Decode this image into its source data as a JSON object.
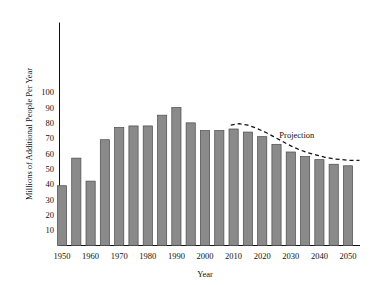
{
  "chart_data": {
    "type": "bar",
    "title": "",
    "xlabel": "Year",
    "ylabel": "Millions of Additional People Per Year",
    "xlim": [
      1947.5,
      2052.5
    ],
    "ylim": [
      0,
      108
    ],
    "grid": false,
    "legend": "none",
    "x_tick_labels": [
      "1950",
      "1960",
      "1970",
      "1980",
      "1990",
      "2000",
      "2010",
      "2020",
      "2030",
      "2040",
      "2050"
    ],
    "x_tick_values": [
      1950,
      1960,
      1970,
      1980,
      1990,
      2000,
      2010,
      2020,
      2030,
      2040,
      2050
    ],
    "y_tick_labels": [
      "10",
      "20",
      "30",
      "40",
      "50",
      "60",
      "70",
      "80",
      "90",
      "100"
    ],
    "y_tick_values": [
      10,
      20,
      30,
      40,
      50,
      60,
      70,
      80,
      90,
      100
    ],
    "categories": [
      1950,
      1955,
      1960,
      1965,
      1970,
      1975,
      1980,
      1985,
      1990,
      1995,
      2000,
      2005,
      2010,
      2015,
      2020,
      2025,
      2030,
      2035,
      2040,
      2045,
      2050
    ],
    "values": [
      39,
      57,
      42,
      69,
      77,
      78,
      78,
      85,
      90,
      80,
      75,
      75,
      76,
      74,
      71,
      66,
      61,
      58,
      56,
      53,
      52
    ],
    "bar_color": "#8a8a8a",
    "bar_edge_color": "#4a4a4a",
    "annotations": [
      {
        "name": "projection-label",
        "text": "Projection",
        "x": 2026,
        "y": 70
      }
    ],
    "series": [
      {
        "name": "Projection",
        "style": "dashed-line",
        "color": "#111111",
        "x": [
          2009,
          2012,
          2015,
          2018,
          2021,
          2024,
          2027,
          2030,
          2033,
          2036,
          2039,
          2042,
          2045,
          2048,
          2051,
          2054
        ],
        "y": [
          78.5,
          79.5,
          78.5,
          76.5,
          74,
          71,
          68,
          65,
          62.5,
          60.5,
          59,
          57.5,
          56.5,
          56,
          55.5,
          55.5
        ]
      }
    ]
  }
}
